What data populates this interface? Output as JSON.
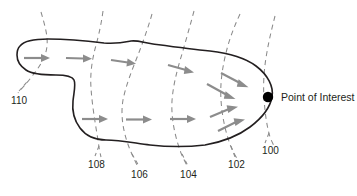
{
  "figure": {
    "type": "technical-diagram",
    "background_color": "#ffffff",
    "outline_color": "#231f20",
    "contour_color": "#8a8a8a",
    "arrow_color": "#8c8c8c",
    "marker_color": "#000000"
  },
  "point_of_interest": {
    "label": "Point of Interest",
    "marker": "filled-circle",
    "x": 268,
    "y": 97
  },
  "reference_numerals": [
    {
      "id": "110",
      "label": "110",
      "x": 11,
      "y": 96,
      "leader": "dashed"
    },
    {
      "id": "108",
      "label": "108",
      "x": 88,
      "y": 160,
      "leader": "dashed"
    },
    {
      "id": "106",
      "label": "106",
      "x": 131,
      "y": 170,
      "leader": "dashed"
    },
    {
      "id": "104",
      "label": "104",
      "x": 180,
      "y": 170,
      "leader": "dashed"
    },
    {
      "id": "102",
      "label": "102",
      "x": 228,
      "y": 160,
      "leader": "dashed"
    },
    {
      "id": "100",
      "label": "100",
      "x": 262,
      "y": 146,
      "leader": "dashed"
    }
  ],
  "contours": [
    {
      "id": "contour-110",
      "numeral": "110"
    },
    {
      "id": "contour-108",
      "numeral": "108"
    },
    {
      "id": "contour-106",
      "numeral": "106"
    },
    {
      "id": "contour-104",
      "numeral": "104"
    },
    {
      "id": "contour-102",
      "numeral": "102"
    },
    {
      "id": "contour-100",
      "numeral": "100"
    }
  ],
  "flow_arrows": {
    "count": 13,
    "direction": "left-to-right converging on point of interest"
  }
}
